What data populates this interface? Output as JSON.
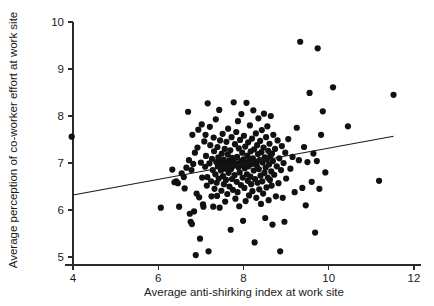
{
  "chart_data": {
    "type": "scatter",
    "title": "",
    "xlabel": "Average anti-shirking index at work site",
    "ylabel": "Average perception of co-worker effort at work site",
    "xlim": [
      4,
      12
    ],
    "ylim": [
      5,
      10
    ],
    "xticks": [
      4,
      6,
      8,
      10,
      12
    ],
    "yticks": [
      5,
      6,
      7,
      8,
      9,
      10
    ],
    "xtick_labels": [
      "4",
      "6",
      "8",
      "10",
      "12"
    ],
    "ytick_labels": [
      "5",
      "6",
      "7",
      "8",
      "9",
      "10"
    ],
    "grid": false,
    "legend": null,
    "marker": {
      "shape": "circle",
      "color": "#111111",
      "size": 3.1
    },
    "trendline": {
      "type": "linear",
      "color": "#1a1a1a",
      "x_start": 4.0,
      "y_start": 6.32,
      "x_end": 11.52,
      "y_end": 7.57,
      "slope": 0.166,
      "intercept": 5.656
    },
    "points": [
      [
        3.97,
        7.56
      ],
      [
        6.06,
        6.05
      ],
      [
        6.33,
        6.86
      ],
      [
        6.38,
        6.59
      ],
      [
        6.42,
        6.61
      ],
      [
        6.46,
        6.57
      ],
      [
        6.49,
        6.07
      ],
      [
        6.55,
        6.78
      ],
      [
        6.6,
        6.7
      ],
      [
        6.62,
        6.46
      ],
      [
        6.66,
        6.9
      ],
      [
        6.7,
        8.09
      ],
      [
        6.72,
        7.06
      ],
      [
        6.74,
        5.92
      ],
      [
        6.76,
        5.75
      ],
      [
        6.78,
        6.85
      ],
      [
        6.79,
        5.7
      ],
      [
        6.8,
        7.6
      ],
      [
        6.82,
        6.98
      ],
      [
        6.84,
        5.97
      ],
      [
        6.86,
        7.22
      ],
      [
        6.88,
        5.04
      ],
      [
        6.9,
        6.35
      ],
      [
        6.92,
        7.33
      ],
      [
        6.94,
        7.71
      ],
      [
        6.96,
        6.27
      ],
      [
        6.98,
        5.39
      ],
      [
        7.0,
        7.01
      ],
      [
        7.02,
        7.82
      ],
      [
        7.03,
        6.69
      ],
      [
        7.05,
        6.12
      ],
      [
        7.06,
        6.07
      ],
      [
        7.08,
        7.46
      ],
      [
        7.1,
        6.92
      ],
      [
        7.11,
        7.6
      ],
      [
        7.12,
        7.15
      ],
      [
        7.14,
        6.52
      ],
      [
        7.15,
        6.7
      ],
      [
        7.16,
        8.27
      ],
      [
        7.18,
        5.12
      ],
      [
        7.2,
        6.99
      ],
      [
        7.21,
        7.77
      ],
      [
        7.22,
        7.38
      ],
      [
        7.24,
        6.61
      ],
      [
        7.25,
        6.29
      ],
      [
        7.26,
        7.09
      ],
      [
        7.28,
        6.85
      ],
      [
        7.29,
        6.07
      ],
      [
        7.3,
        7.54
      ],
      [
        7.31,
        7.25
      ],
      [
        7.32,
        6.45
      ],
      [
        7.34,
        6.76
      ],
      [
        7.35,
        7.93
      ],
      [
        7.36,
        7.02
      ],
      [
        7.37,
        6.58
      ],
      [
        7.38,
        6.3
      ],
      [
        7.39,
        7.34
      ],
      [
        7.4,
        6.93
      ],
      [
        7.41,
        7.12
      ],
      [
        7.42,
        6.67
      ],
      [
        7.43,
        8.13
      ],
      [
        7.44,
        6.05
      ],
      [
        7.45,
        7.48
      ],
      [
        7.46,
        7.01
      ],
      [
        7.47,
        6.84
      ],
      [
        7.48,
        6.41
      ],
      [
        7.49,
        7.2
      ],
      [
        7.5,
        6.95
      ],
      [
        7.51,
        7.62
      ],
      [
        7.52,
        6.72
      ],
      [
        7.53,
        7.07
      ],
      [
        7.54,
        6.55
      ],
      [
        7.55,
        6.88
      ],
      [
        7.56,
        7.3
      ],
      [
        7.57,
        6.18
      ],
      [
        7.58,
        7.0
      ],
      [
        7.59,
        6.64
      ],
      [
        7.6,
        7.45
      ],
      [
        7.61,
        6.9
      ],
      [
        7.62,
        6.34
      ],
      [
        7.63,
        7.18
      ],
      [
        7.64,
        7.73
      ],
      [
        7.65,
        6.79
      ],
      [
        7.66,
        7.05
      ],
      [
        7.67,
        6.5
      ],
      [
        7.68,
        6.97
      ],
      [
        7.69,
        7.27
      ],
      [
        7.7,
        5.58
      ],
      [
        7.71,
        6.87
      ],
      [
        7.72,
        7.55
      ],
      [
        7.73,
        6.66
      ],
      [
        7.74,
        7.11
      ],
      [
        7.75,
        6.43
      ],
      [
        7.76,
        6.94
      ],
      [
        7.77,
        8.29
      ],
      [
        7.78,
        7.02
      ],
      [
        7.79,
        6.74
      ],
      [
        7.8,
        7.4
      ],
      [
        7.81,
        6.24
      ],
      [
        7.82,
        6.99
      ],
      [
        7.83,
        7.66
      ],
      [
        7.84,
        6.6
      ],
      [
        7.85,
        7.13
      ],
      [
        7.86,
        6.38
      ],
      [
        7.87,
        7.89
      ],
      [
        7.88,
        6.91
      ],
      [
        7.89,
        7.31
      ],
      [
        7.9,
        6.08
      ],
      [
        7.91,
        6.8
      ],
      [
        7.92,
        7.49
      ],
      [
        7.93,
        7.04
      ],
      [
        7.94,
        6.53
      ],
      [
        7.95,
        8.04
      ],
      [
        7.96,
        6.96
      ],
      [
        7.97,
        7.22
      ],
      [
        7.98,
        6.69
      ],
      [
        7.99,
        5.77
      ],
      [
        8.0,
        7.08
      ],
      [
        8.01,
        7.58
      ],
      [
        8.02,
        6.47
      ],
      [
        8.03,
        6.89
      ],
      [
        8.04,
        7.35
      ],
      [
        8.05,
        6.19
      ],
      [
        8.06,
        7.0
      ],
      [
        8.07,
        8.28
      ],
      [
        8.08,
        6.76
      ],
      [
        8.09,
        7.16
      ],
      [
        8.1,
        6.62
      ],
      [
        8.11,
        7.44
      ],
      [
        8.12,
        6.93
      ],
      [
        8.13,
        6.31
      ],
      [
        8.14,
        7.07
      ],
      [
        8.15,
        7.8
      ],
      [
        8.16,
        6.71
      ],
      [
        8.17,
        7.25
      ],
      [
        8.18,
        6.55
      ],
      [
        8.19,
        6.98
      ],
      [
        8.2,
        7.52
      ],
      [
        8.21,
        6.4
      ],
      [
        8.22,
        7.1
      ],
      [
        8.23,
        8.12
      ],
      [
        8.24,
        6.84
      ],
      [
        8.25,
        7.29
      ],
      [
        8.26,
        5.31
      ],
      [
        8.27,
        6.66
      ],
      [
        8.28,
        7.03
      ],
      [
        8.29,
        7.63
      ],
      [
        8.3,
        6.26
      ],
      [
        8.31,
        6.95
      ],
      [
        8.32,
        7.38
      ],
      [
        8.33,
        6.58
      ],
      [
        8.34,
        7.19
      ],
      [
        8.35,
        7.95
      ],
      [
        8.36,
        6.87
      ],
      [
        8.37,
        6.44
      ],
      [
        8.38,
        7.06
      ],
      [
        8.39,
        7.47
      ],
      [
        8.4,
        6.73
      ],
      [
        8.41,
        6.13
      ],
      [
        8.42,
        7.23
      ],
      [
        8.43,
        7.7
      ],
      [
        8.44,
        6.61
      ],
      [
        8.45,
        7.01
      ],
      [
        8.46,
        6.35
      ],
      [
        8.47,
        7.33
      ],
      [
        8.48,
        8.05
      ],
      [
        8.49,
        6.79
      ],
      [
        8.5,
        7.12
      ],
      [
        8.51,
        5.83
      ],
      [
        8.52,
        6.9
      ],
      [
        8.53,
        7.55
      ],
      [
        8.54,
        6.48
      ],
      [
        8.55,
        7.08
      ],
      [
        8.56,
        7.78
      ],
      [
        8.57,
        6.69
      ],
      [
        8.58,
        7.26
      ],
      [
        8.59,
        6.21
      ],
      [
        8.6,
        6.97
      ],
      [
        8.61,
        7.41
      ],
      [
        8.62,
        6.64
      ],
      [
        8.63,
        7.15
      ],
      [
        8.64,
        8.0
      ],
      [
        8.65,
        6.82
      ],
      [
        8.66,
        6.52
      ],
      [
        8.67,
        7.2
      ],
      [
        8.68,
        5.69
      ],
      [
        8.69,
        7.04
      ],
      [
        8.7,
        7.6
      ],
      [
        8.72,
        6.75
      ],
      [
        8.74,
        7.3
      ],
      [
        8.76,
        6.29
      ],
      [
        8.78,
        6.93
      ],
      [
        8.8,
        7.48
      ],
      [
        8.82,
        6.57
      ],
      [
        8.84,
        7.1
      ],
      [
        8.86,
        5.12
      ],
      [
        8.88,
        6.85
      ],
      [
        8.9,
        7.36
      ],
      [
        8.92,
        6.26
      ],
      [
        8.94,
        7.0
      ],
      [
        8.96,
        5.75
      ],
      [
        8.98,
        7.22
      ],
      [
        9.0,
        6.67
      ],
      [
        9.05,
        7.51
      ],
      [
        9.1,
        6.88
      ],
      [
        9.15,
        7.13
      ],
      [
        9.2,
        6.38
      ],
      [
        9.25,
        7.75
      ],
      [
        9.3,
        7.06
      ],
      [
        9.33,
        9.58
      ],
      [
        9.38,
        6.47
      ],
      [
        9.42,
        7.34
      ],
      [
        9.46,
        6.1
      ],
      [
        9.5,
        7.02
      ],
      [
        9.55,
        8.49
      ],
      [
        9.6,
        6.6
      ],
      [
        9.64,
        7.2
      ],
      [
        9.68,
        5.52
      ],
      [
        9.72,
        7.04
      ],
      [
        9.74,
        9.44
      ],
      [
        9.78,
        6.45
      ],
      [
        9.82,
        7.6
      ],
      [
        9.86,
        8.1
      ],
      [
        9.92,
        6.8
      ],
      [
        10.1,
        8.61
      ],
      [
        10.45,
        7.78
      ],
      [
        11.18,
        6.62
      ],
      [
        11.52,
        8.45
      ]
    ]
  },
  "axes_geometry": {
    "x_pixel_min": 73,
    "x_pixel_max": 414,
    "y_pixel_min": 22,
    "y_pixel_max": 257
  }
}
